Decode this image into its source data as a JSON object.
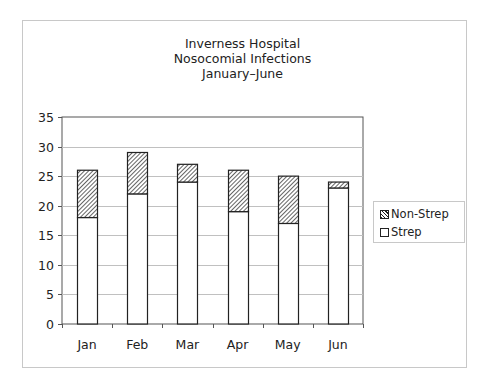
{
  "title_lines": [
    "Inverness Hospital",
    "Nosocomial Infections",
    "January–June"
  ],
  "legend": [
    {
      "label": "Non-Strep",
      "pattern": "hatched"
    },
    {
      "label": "Strep",
      "pattern": "white"
    }
  ],
  "colors": {
    "bar_border": "#222222",
    "hatch": "#222222",
    "gridline": "#c0c0c0",
    "frame_border": "#c8c8c8"
  },
  "chart_data": {
    "type": "bar",
    "stacked": true,
    "title": "Inverness Hospital Nosocomial Infections January–June",
    "categories": [
      "Jan",
      "Feb",
      "Mar",
      "Apr",
      "May",
      "Jun"
    ],
    "series": [
      {
        "name": "Strep",
        "values": [
          18,
          22,
          24,
          19,
          17,
          23
        ],
        "fill": "white"
      },
      {
        "name": "Non-Strep",
        "values": [
          8,
          7,
          3,
          7,
          8,
          1
        ],
        "fill": "diagonal-hatch"
      }
    ],
    "totals": [
      26,
      29,
      27,
      26,
      25,
      24
    ],
    "xlabel": "",
    "ylabel": "",
    "ylim": [
      0,
      35
    ],
    "yticks": [
      0,
      5,
      10,
      15,
      20,
      25,
      30,
      35
    ],
    "grid": true,
    "legend_position": "right"
  }
}
